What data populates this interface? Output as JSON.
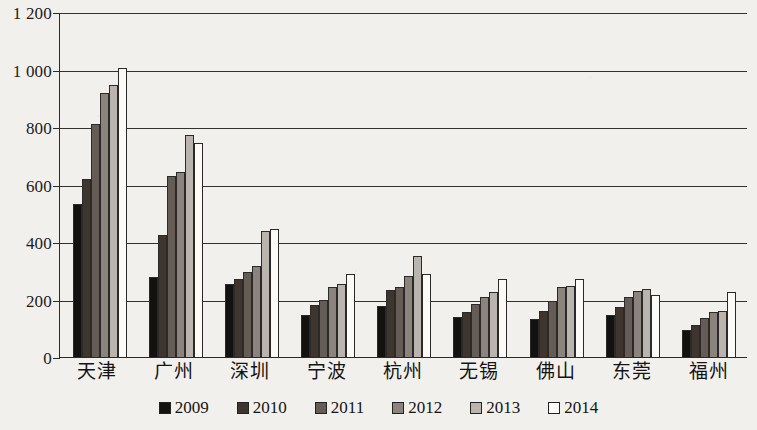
{
  "chart_data": {
    "type": "bar",
    "title": "",
    "subtitle": "",
    "xlabel": "",
    "ylabel": "",
    "ylim": [
      0,
      1200
    ],
    "yticks": [
      0,
      200,
      400,
      600,
      800,
      1000,
      1200
    ],
    "ytick_labels": [
      "0",
      "200",
      "400",
      "600",
      "800",
      "1 000",
      "1 200"
    ],
    "grid": true,
    "legend_position": "bottom",
    "categories": [
      "天津",
      "广州",
      "深圳",
      "宁波",
      "杭州",
      "无锡",
      "佛山",
      "东莞",
      "福州"
    ],
    "series": [
      {
        "name": "2009",
        "color": "#141210",
        "values": [
          533,
          280,
          255,
          145,
          178,
          140,
          132,
          145,
          95
        ]
      },
      {
        "name": "2010",
        "color": "#3e352f",
        "values": [
          620,
          423,
          270,
          180,
          232,
          155,
          160,
          175,
          110
        ]
      },
      {
        "name": "2011",
        "color": "#645c55",
        "values": [
          810,
          630,
          295,
          200,
          245,
          185,
          195,
          210,
          135
        ]
      },
      {
        "name": "2012",
        "color": "#8b847c",
        "values": [
          920,
          645,
          317,
          245,
          283,
          210,
          245,
          230,
          155
        ]
      },
      {
        "name": "2013",
        "color": "#b9b5ae",
        "values": [
          945,
          773,
          440,
          255,
          350,
          225,
          247,
          235,
          160
        ]
      },
      {
        "name": "2014",
        "color": "#fbfaf7",
        "values": [
          1005,
          745,
          445,
          290,
          290,
          270,
          270,
          215,
          225
        ]
      }
    ]
  }
}
